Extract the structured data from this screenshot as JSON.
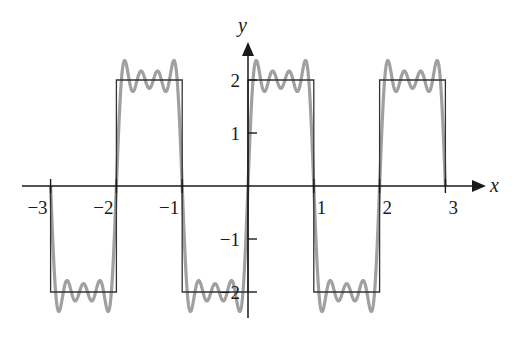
{
  "chart_data": {
    "type": "line",
    "title": "",
    "xlabel": "x",
    "ylabel": "y",
    "xlim": [
      -3,
      3
    ],
    "ylim": [
      -2.4,
      2.4
    ],
    "grid": false,
    "legend": null,
    "x_ticks": [
      -3,
      -2,
      -1,
      1,
      2,
      3
    ],
    "x_tick_labels": [
      "−3",
      "−2",
      "−1",
      "1",
      "2",
      "3"
    ],
    "y_ticks": [
      2,
      1,
      -1,
      -2
    ],
    "y_tick_labels": [
      "2",
      "1",
      "−1",
      "−2"
    ],
    "series": [
      {
        "name": "square wave",
        "kind": "piecewise-constant",
        "color": "#333333",
        "amplitude": 2,
        "period": 2,
        "segments": [
          {
            "x0": -3,
            "x1": -2,
            "y": -2
          },
          {
            "x0": -2,
            "x1": -1,
            "y": 2
          },
          {
            "x0": -1,
            "x1": 0,
            "y": -2
          },
          {
            "x0": 0,
            "x1": 1,
            "y": 2
          },
          {
            "x0": 1,
            "x1": 2,
            "y": -2
          },
          {
            "x0": 2,
            "x1": 3,
            "y": 2
          }
        ]
      },
      {
        "name": "Fourier partial sum",
        "kind": "fourier-sine-odd-harmonics",
        "color": "#a0a0a0",
        "description": "(8/π) Σ sin(nπx)/n, n = 1,3,5,7",
        "harmonics": [
          1,
          3,
          5,
          7
        ],
        "coefficient": 2.546
      }
    ]
  },
  "layout": {
    "origin_px": [
      248,
      186
    ],
    "px_per_x": 65.8,
    "px_per_y": 53.0,
    "axis_color": "#1a1a1a",
    "square_color": "#333333",
    "fourier_color": "#a0a0a0"
  }
}
